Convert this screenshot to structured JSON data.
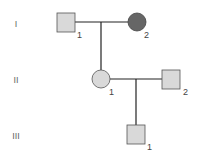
{
  "diagram": {
    "type": "pedigree",
    "generations": [
      {
        "label": "I",
        "members": [
          {
            "id": "I-1",
            "number": "1",
            "sex": "male",
            "affected": false
          },
          {
            "id": "I-2",
            "number": "2",
            "sex": "female",
            "affected": true
          }
        ]
      },
      {
        "label": "II",
        "members": [
          {
            "id": "II-1",
            "number": "1",
            "sex": "female",
            "affected": false
          },
          {
            "id": "II-2",
            "number": "2",
            "sex": "male",
            "affected": false
          }
        ]
      },
      {
        "label": "III",
        "members": [
          {
            "id": "III-1",
            "number": "1",
            "sex": "male",
            "affected": false
          }
        ]
      }
    ],
    "colors": {
      "unaffected_fill": "#d9d9d9",
      "affected_fill": "#666666",
      "stroke": "#555555",
      "line": "#222222"
    }
  }
}
